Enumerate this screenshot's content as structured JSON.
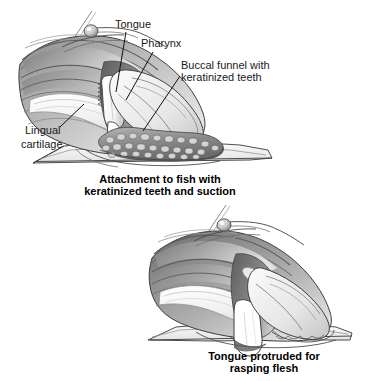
{
  "figure": {
    "background_color": "#ffffff",
    "ink_color": "#1a1a1a",
    "panels": [
      {
        "id": "panel-attachment",
        "caption_lines": [
          "Attachment to fish with",
          "keratinized teeth and suction"
        ],
        "labels": [
          {
            "id": "tongue",
            "text": "Tongue",
            "x": 115,
            "y": 28
          },
          {
            "id": "pharynx",
            "text": "Pharynx",
            "x": 141,
            "y": 47
          },
          {
            "id": "buccal-funnel",
            "text": "Buccal funnel with",
            "text2": "keratinized teeth",
            "x": 181,
            "y": 69
          },
          {
            "id": "lingual-cartilage",
            "text": "Lingual",
            "text2": "cartilage",
            "x": 25,
            "y": 134
          }
        ]
      },
      {
        "id": "panel-protruded",
        "caption_lines": [
          "Tongue protruded for",
          "rasping flesh"
        ],
        "labels": []
      }
    ],
    "colors": {
      "outline": "#2b2b2b",
      "mid_gray": "#9a9a9a",
      "dark_gray": "#6e6e6e",
      "light_gray": "#d9d9d9",
      "pale": "#f2f2f2",
      "teeth_gray": "#8c8c8c"
    }
  }
}
